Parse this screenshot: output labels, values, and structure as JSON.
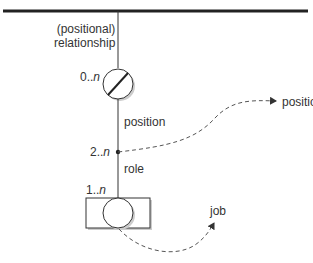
{
  "diagram": {
    "top_bar_label": "",
    "relationship_label_line1": "(positional)",
    "relationship_label_line2": "relationship",
    "mult_top": {
      "prefix": "0..",
      "var": "n"
    },
    "position_label": "position",
    "mult_mid": {
      "prefix": "2..",
      "var": "n"
    },
    "role_label": "role",
    "mult_bottom": {
      "prefix": "1..",
      "var": "n"
    },
    "arrow_target_position": "position",
    "arrow_target_job": "job",
    "colors": {
      "line": "#333333",
      "shadow": "#bbbbbb",
      "text": "#333333"
    }
  }
}
